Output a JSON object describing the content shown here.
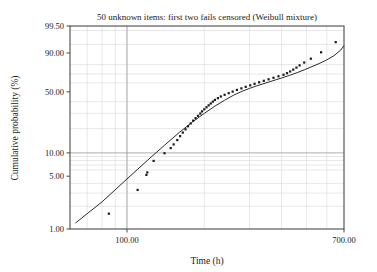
{
  "chart_data": {
    "type": "scatter",
    "title": "50 unknown items: first two fails censored (Weibull mixture)",
    "xlabel": "Time (h)",
    "ylabel": "Cumulative probability (%)",
    "x_scale": "log",
    "y_scale": "weibull-probability",
    "grid": true,
    "legend": "none",
    "xlim": [
      60,
      700
    ],
    "ylim": [
      1.0,
      99.5
    ],
    "xticks": [
      "100.00",
      "700.00"
    ],
    "xtick_values": [
      100,
      700
    ],
    "yticks": [
      "99.50",
      "90.00",
      "50.00",
      "10.00",
      "5.00",
      "1.00"
    ],
    "ytick_values": [
      99.5,
      90.0,
      50.0,
      10.0,
      5.0,
      1.0
    ],
    "series": [
      {
        "name": "failure data points",
        "marker": "square-dot",
        "color": "#1a1a1a",
        "points": [
          [
            85,
            1.6
          ],
          [
            110,
            3.3
          ],
          [
            119,
            5.2
          ],
          [
            120,
            5.6
          ],
          [
            127,
            7.9
          ],
          [
            140,
            9.9
          ],
          [
            148,
            11.5
          ],
          [
            152,
            12.8
          ],
          [
            157,
            14.5
          ],
          [
            161,
            16.2
          ],
          [
            165,
            17.9
          ],
          [
            169,
            19.6
          ],
          [
            173,
            21.3
          ],
          [
            177,
            23.0
          ],
          [
            181,
            24.8
          ],
          [
            185,
            26.5
          ],
          [
            189,
            28.2
          ],
          [
            193,
            29.9
          ],
          [
            196,
            31.6
          ],
          [
            200,
            33.3
          ],
          [
            204,
            35.0
          ],
          [
            208,
            36.7
          ],
          [
            212,
            38.4
          ],
          [
            216,
            40.1
          ],
          [
            220,
            41.8
          ],
          [
            226,
            43.5
          ],
          [
            232,
            45.2
          ],
          [
            240,
            46.9
          ],
          [
            249,
            48.6
          ],
          [
            258,
            50.3
          ],
          [
            268,
            52.1
          ],
          [
            279,
            53.8
          ],
          [
            290,
            55.5
          ],
          [
            302,
            57.2
          ],
          [
            314,
            58.9
          ],
          [
            327,
            60.6
          ],
          [
            341,
            62.3
          ],
          [
            356,
            64.0
          ],
          [
            372,
            65.7
          ],
          [
            389,
            67.4
          ],
          [
            407,
            69.1
          ],
          [
            420,
            70.9
          ],
          [
            432,
            72.8
          ],
          [
            444,
            74.8
          ],
          [
            457,
            76.9
          ],
          [
            470,
            79.2
          ],
          [
            490,
            82.0
          ],
          [
            520,
            85.5
          ],
          [
            570,
            90.5
          ],
          [
            650,
            96.0
          ]
        ]
      },
      {
        "name": "fitted Weibull mixture line",
        "style": "solid",
        "color": "#2b2b2b",
        "points": [
          [
            63,
            1.2
          ],
          [
            80,
            2.3
          ],
          [
            100,
            4.6
          ],
          [
            120,
            8.0
          ],
          [
            140,
            12.5
          ],
          [
            160,
            18.0
          ],
          [
            180,
            24.0
          ],
          [
            200,
            30.0
          ],
          [
            220,
            36.0
          ],
          [
            240,
            41.5
          ],
          [
            260,
            46.5
          ],
          [
            280,
            50.5
          ],
          [
            300,
            53.8
          ],
          [
            320,
            56.6
          ],
          [
            345,
            59.6
          ],
          [
            370,
            62.4
          ],
          [
            400,
            65.5
          ],
          [
            430,
            68.5
          ],
          [
            460,
            71.5
          ],
          [
            490,
            74.5
          ],
          [
            520,
            77.5
          ],
          [
            560,
            81.0
          ],
          [
            600,
            84.5
          ],
          [
            640,
            88.0
          ],
          [
            680,
            92.0
          ],
          [
            700,
            94.5
          ]
        ]
      }
    ]
  },
  "plot_geometry": {
    "left": 70,
    "right": 344,
    "top": 26,
    "bottom": 229
  },
  "style": {
    "axis_color": "#4a4a4a",
    "grid_color": "#d8d8d8",
    "major_grid_color": "#9a9a9a",
    "point_color": "#1a1a1a",
    "line_color": "#2b2b2b",
    "background": "#ffffff"
  }
}
